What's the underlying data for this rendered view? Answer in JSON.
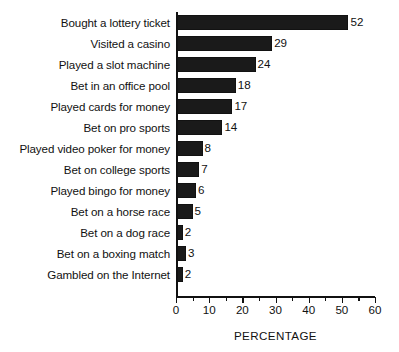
{
  "chart_data": {
    "type": "bar",
    "orientation": "horizontal",
    "title": "",
    "xlabel": "PERCENTAGE",
    "ylabel": "",
    "xlim": [
      0,
      60
    ],
    "grid": false,
    "legend": null,
    "bar_color": "#1a1a1a",
    "background_color": "#ffffff",
    "xticks": [
      0,
      10,
      20,
      30,
      40,
      50,
      60
    ],
    "xtick_labels": [
      "0",
      "10",
      "20",
      "30",
      "40",
      "50",
      "60"
    ],
    "minor_tick_interval": 5,
    "categories": [
      "Bought a lottery ticket",
      "Visited a casino",
      "Played a slot machine",
      "Bet in an office pool",
      "Played cards for money",
      "Bet on pro sports",
      "Played video poker for money",
      "Bet on college sports",
      "Played bingo for money",
      "Bet on a horse race",
      "Bet on a dog race",
      "Bet on a boxing match",
      "Gambled on the Internet"
    ],
    "values": [
      52,
      29,
      24,
      18,
      17,
      14,
      8,
      7,
      6,
      5,
      2,
      3,
      2
    ],
    "value_labels": [
      "52",
      "29",
      "24",
      "18",
      "17",
      "14",
      "8",
      "7",
      "6",
      "5",
      "2",
      "3",
      "2"
    ]
  }
}
